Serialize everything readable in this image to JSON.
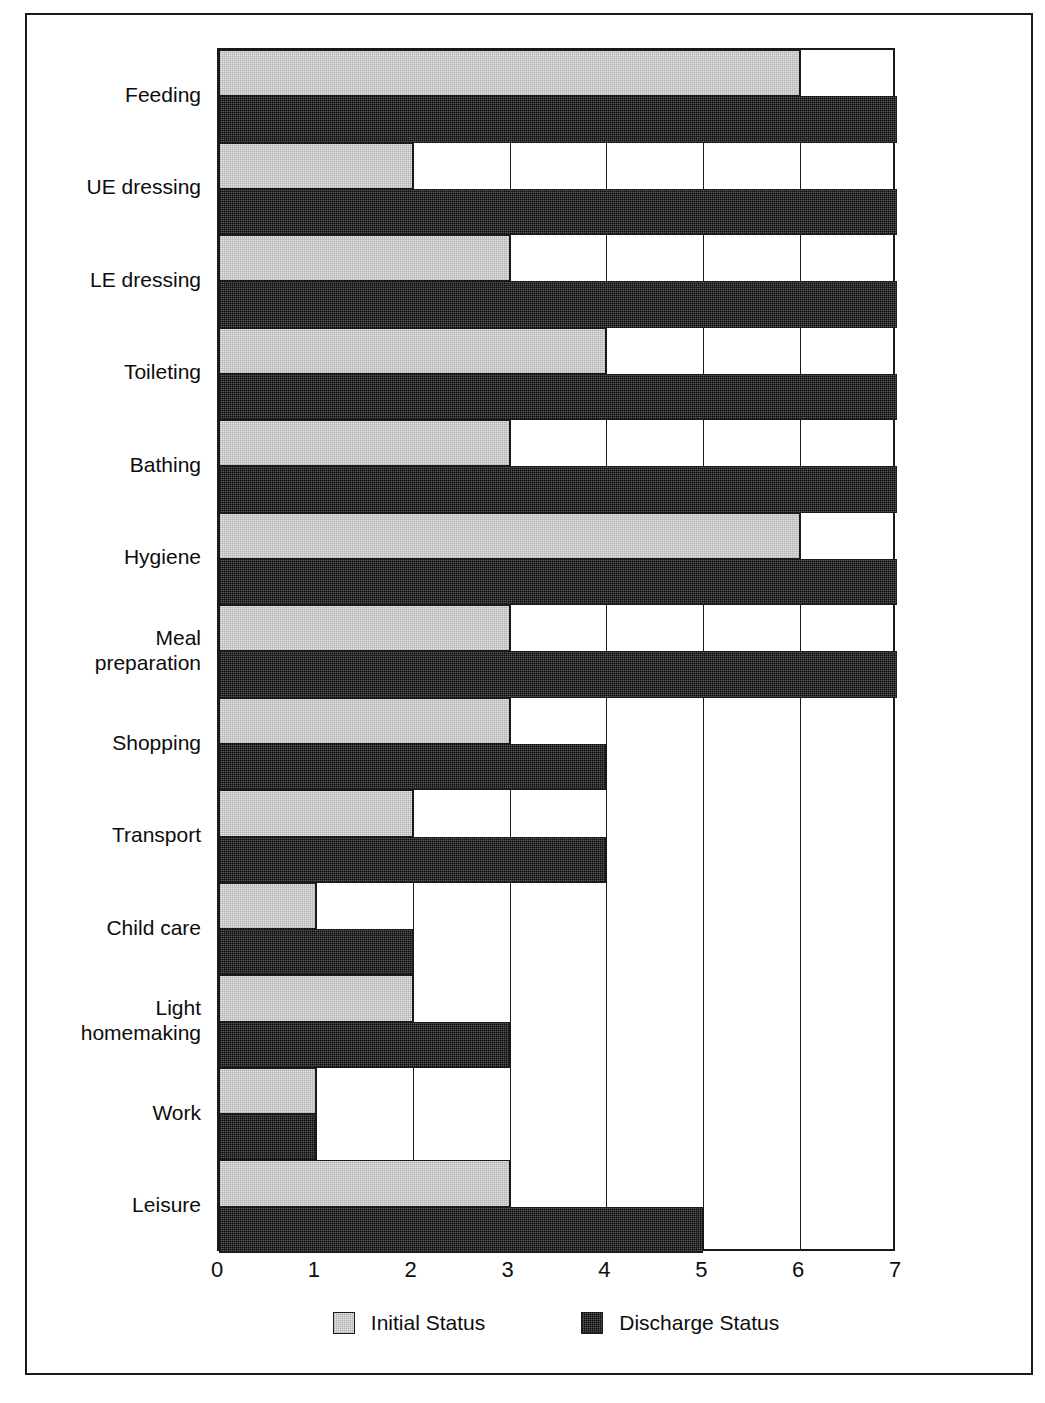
{
  "chart_data": {
    "type": "bar",
    "orientation": "horizontal",
    "title": "",
    "subtitle": "",
    "xlabel": "",
    "ylabel": "",
    "xlim": [
      0,
      7
    ],
    "xticks": [
      "0",
      "1",
      "2",
      "3",
      "4",
      "5",
      "6",
      "7"
    ],
    "grid": true,
    "grid_axis": "x",
    "legend_position": "bottom-center",
    "categories": [
      "Feeding",
      "UE dressing",
      "LE dressing",
      "Toileting",
      "Bathing",
      "Hygiene",
      "Meal\npreparation",
      "Shopping",
      "Transport",
      "Child care",
      "Light\nhomemaking",
      "Work",
      "Leisure"
    ],
    "series": [
      {
        "name": "Initial Status",
        "color": "#e3e3e3",
        "values": [
          6,
          2,
          3,
          4,
          3,
          6,
          3,
          3,
          2,
          1,
          2,
          1,
          3
        ]
      },
      {
        "name": "Discharge Status",
        "color": "#585858",
        "values": [
          7,
          7,
          7,
          7,
          7,
          7,
          7,
          4,
          4,
          2,
          3,
          1,
          5
        ]
      }
    ]
  },
  "legend": {
    "items": [
      {
        "label": "Initial Status",
        "swatch": "initial"
      },
      {
        "label": "Discharge Status",
        "swatch": "discharge"
      }
    ]
  },
  "colors": {
    "initial": "#e3e3e3",
    "discharge": "#585858",
    "axis": "#1a1a1a",
    "background": "#ffffff"
  }
}
